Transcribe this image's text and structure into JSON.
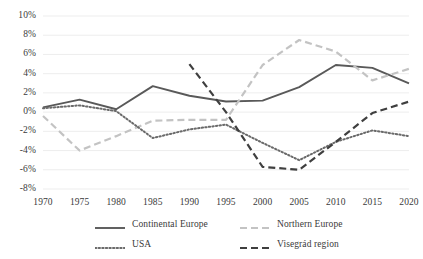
{
  "chart_data": {
    "type": "line",
    "title": "",
    "xlabel": "",
    "ylabel": "",
    "x": [
      1970,
      1975,
      1980,
      1985,
      1990,
      1995,
      2000,
      2005,
      2010,
      2015,
      2020
    ],
    "xtick_labels": [
      "1970",
      "1975",
      "1980",
      "1985",
      "1990",
      "1995",
      "2000",
      "2005",
      "2010",
      "2015",
      "2020"
    ],
    "ytick_labels": [
      "10%",
      "8%",
      "6%",
      "4%",
      "2%",
      "0%",
      "-2%",
      "-4%",
      "-6%",
      "-8%"
    ],
    "ytick_values": [
      10,
      8,
      6,
      4,
      2,
      0,
      -2,
      -4,
      -6,
      -8
    ],
    "ylim": [
      -8,
      10
    ],
    "xlim": [
      1970,
      2020
    ],
    "grid": "horizontal",
    "legend_position": "bottom",
    "series": [
      {
        "name": "Continental Europe",
        "style": "solid",
        "color": "#595959",
        "x": [
          1970,
          1975,
          1980,
          1985,
          1990,
          1995,
          2000,
          2005,
          2010,
          2015,
          2020
        ],
        "values": [
          0.5,
          1.3,
          0.3,
          2.7,
          1.7,
          1.1,
          1.2,
          2.6,
          4.9,
          4.6,
          3.0
        ]
      },
      {
        "name": "Northern Europe",
        "style": "dashed",
        "color": "#c3c3c3",
        "x": [
          1970,
          1975,
          1980,
          1985,
          1990,
          1995,
          2000,
          2005,
          2010,
          2015,
          2020
        ],
        "values": [
          -0.4,
          -4.0,
          -2.5,
          -0.9,
          -0.8,
          -0.8,
          4.9,
          7.5,
          6.3,
          3.3,
          4.5
        ]
      },
      {
        "name": "USA",
        "style": "dotted",
        "color": "#6a6a6a",
        "x": [
          1970,
          1975,
          1980,
          1985,
          1990,
          1995,
          2000,
          2005,
          2010,
          2015,
          2020
        ],
        "values": [
          0.4,
          0.7,
          0.1,
          -2.7,
          -1.8,
          -1.3,
          -3.2,
          -5.0,
          -3.1,
          -1.9,
          -2.5
        ]
      },
      {
        "name": "Visegrád region",
        "style": "dashed",
        "color": "#3f3f3f",
        "x": [
          1990,
          1995,
          2000,
          2005,
          2010,
          2015,
          2020
        ],
        "values": [
          5.0,
          0.0,
          -5.7,
          -6.0,
          -3.1,
          -0.1,
          1.1
        ]
      }
    ]
  },
  "legend": {
    "items": [
      {
        "label": "Continental Europe"
      },
      {
        "label": "Northern Europe"
      },
      {
        "label": "USA"
      },
      {
        "label": "Visegrád region"
      }
    ]
  }
}
